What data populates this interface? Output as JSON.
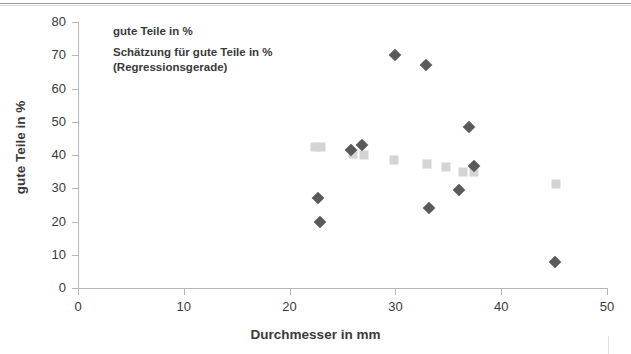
{
  "chart_data": {
    "type": "scatter",
    "title": "",
    "xlabel": "Durchmesser in mm",
    "ylabel": "gute Teile in %",
    "xlim": [
      0,
      50
    ],
    "ylim": [
      0,
      80
    ],
    "xticks": [
      0,
      10,
      20,
      30,
      40,
      50
    ],
    "yticks": [
      0,
      10,
      20,
      30,
      40,
      50,
      60,
      70,
      80
    ],
    "grid": false,
    "legend_position": "top-left",
    "series": [
      {
        "name": "gute Teile in %",
        "marker": "diamond",
        "color": "#5a5a5a",
        "points": [
          {
            "x": 22.7,
            "y": 27.0
          },
          {
            "x": 22.9,
            "y": 20.0
          },
          {
            "x": 25.8,
            "y": 41.5
          },
          {
            "x": 26.8,
            "y": 43.0
          },
          {
            "x": 30.0,
            "y": 70.0
          },
          {
            "x": 32.9,
            "y": 67.0
          },
          {
            "x": 33.2,
            "y": 24.0
          },
          {
            "x": 36.0,
            "y": 29.5
          },
          {
            "x": 37.0,
            "y": 48.5
          },
          {
            "x": 37.4,
            "y": 36.8
          },
          {
            "x": 45.1,
            "y": 7.8
          }
        ]
      },
      {
        "name": "Schätzung für gute Teile in %\n(Regressionsgerade)",
        "marker": "square",
        "color": "#d4d4d4",
        "points": [
          {
            "x": 22.4,
            "y": 42.3
          },
          {
            "x": 23.0,
            "y": 42.3
          },
          {
            "x": 26.0,
            "y": 40.2
          },
          {
            "x": 27.0,
            "y": 40.0
          },
          {
            "x": 29.9,
            "y": 38.6
          },
          {
            "x": 33.0,
            "y": 37.4
          },
          {
            "x": 34.8,
            "y": 36.3
          },
          {
            "x": 36.4,
            "y": 35.0
          },
          {
            "x": 37.4,
            "y": 35.0
          },
          {
            "x": 45.2,
            "y": 31.2
          }
        ]
      }
    ]
  },
  "legend": {
    "items": [
      {
        "label": "gute Teile in %",
        "marker": "diamond"
      },
      {
        "label": "Schätzung für gute Teile in %\n(Regressionsgerade)",
        "marker": "square"
      }
    ]
  }
}
